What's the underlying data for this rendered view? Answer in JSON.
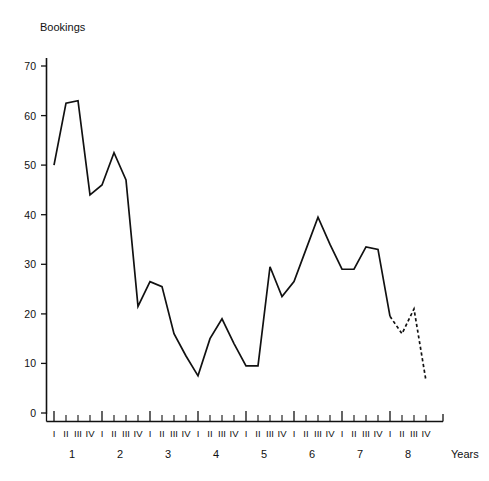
{
  "chart_data": {
    "type": "line",
    "title": "",
    "ylabel": "Bookings",
    "xlabel": "Years",
    "ylim": [
      0,
      70
    ],
    "yticks": [
      0,
      10,
      20,
      30,
      40,
      50,
      60,
      70
    ],
    "grid": false,
    "legend": "none",
    "quarter_labels": [
      "I",
      "II",
      "III",
      "IV"
    ],
    "year_labels": [
      "1",
      "2",
      "3",
      "4",
      "5",
      "6",
      "7",
      "8"
    ],
    "categories": [
      "1 I",
      "1 II",
      "1 III",
      "1 IV",
      "2 I",
      "2 II",
      "2 III",
      "2 IV",
      "3 I",
      "3 II",
      "3 III",
      "3 IV",
      "4 I",
      "4 II",
      "4 III",
      "4 IV",
      "5 I",
      "5 II",
      "5 III",
      "5 IV",
      "6 I",
      "6 II",
      "6 III",
      "6 IV",
      "7 I",
      "7 II",
      "7 III",
      "7 IV",
      "8 I",
      "8 II",
      "8 III",
      "8 IV"
    ],
    "series": [
      {
        "name": "Bookings actual",
        "style": "solid",
        "values": [
          50,
          62.5,
          63,
          44,
          46,
          52.5,
          47,
          21.5,
          26.5,
          25.5,
          16,
          11.5,
          7.5,
          15,
          19,
          14,
          9.5,
          9.5,
          29.5,
          23.5,
          26.5,
          33,
          39.5,
          34,
          29,
          29,
          33.5,
          33,
          19.5,
          null,
          null,
          null
        ]
      },
      {
        "name": "Bookings forecast",
        "style": "dashed",
        "values": [
          null,
          null,
          null,
          null,
          null,
          null,
          null,
          null,
          null,
          null,
          null,
          null,
          null,
          null,
          null,
          null,
          null,
          null,
          null,
          null,
          null,
          null,
          null,
          null,
          null,
          null,
          null,
          null,
          19.5,
          16,
          21,
          6.5
        ]
      }
    ],
    "accent_color": "#111111"
  }
}
